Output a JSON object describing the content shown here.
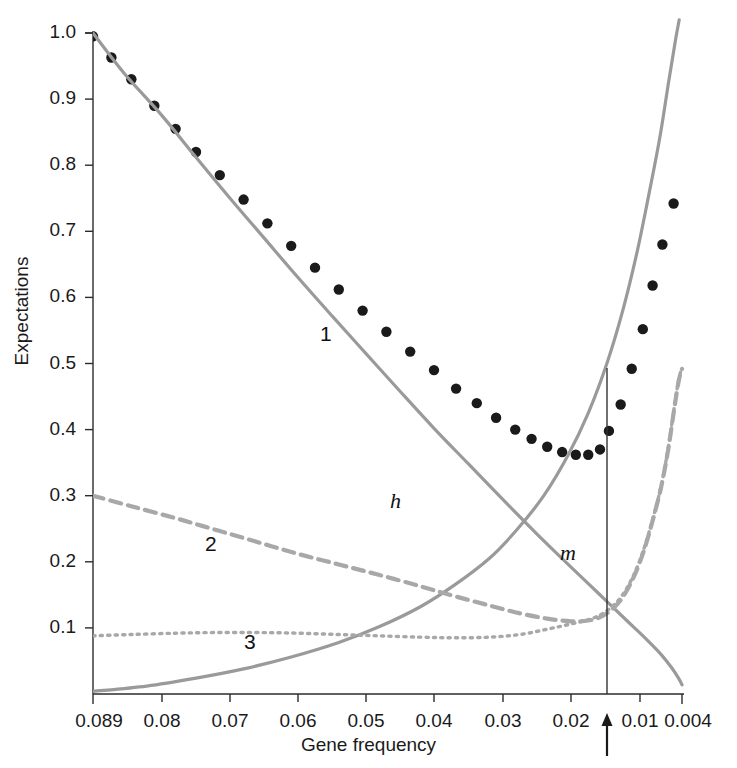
{
  "chart_data": {
    "type": "line",
    "title": "",
    "xlabel": "Gene frequency",
    "ylabel": "Expectations",
    "xtick_labels": [
      "0.089",
      "0.08",
      "0.07",
      "0.06",
      "0.05",
      "0.04",
      "0.03",
      "0.02",
      "0.01",
      "0.004"
    ],
    "xtick_values": [
      0.089,
      0.08,
      0.07,
      0.06,
      0.05,
      0.04,
      0.03,
      0.02,
      0.01,
      0.004
    ],
    "xtick_px": [
      93,
      162,
      230,
      298,
      366,
      434,
      503,
      571,
      640,
      682
    ],
    "ytick_labels": [
      "0.1",
      "0.2",
      "0.3",
      "0.4",
      "0.5",
      "0.6",
      "0.7",
      "0.8",
      "0.9",
      "1.0"
    ],
    "ytick_values": [
      0.1,
      0.2,
      0.3,
      0.4,
      0.5,
      0.6,
      0.7,
      0.8,
      0.9,
      1.0
    ],
    "ylim": [
      0.0,
      1.02
    ],
    "grid": false,
    "legend": "inline-curve-labels",
    "axis_style": "left-and-bottom-spines",
    "annotations": [
      {
        "name": "arrow-marker",
        "type": "up-arrow",
        "x": 0.0145,
        "x_px": 607,
        "note": "vertical reference line with upward arrow below axis"
      }
    ],
    "series": [
      {
        "name": "1",
        "label": "1",
        "style": "dots",
        "marker": "filled-circle",
        "color": "#1a1a1a",
        "label_x_px": 320,
        "label_y_px": 322,
        "points": [
          {
            "x": 0.089,
            "y": 0.995
          },
          {
            "x": 0.0866,
            "y": 0.963
          },
          {
            "x": 0.084,
            "y": 0.93
          },
          {
            "x": 0.081,
            "y": 0.89
          },
          {
            "x": 0.078,
            "y": 0.855
          },
          {
            "x": 0.075,
            "y": 0.82
          },
          {
            "x": 0.0715,
            "y": 0.785
          },
          {
            "x": 0.068,
            "y": 0.748
          },
          {
            "x": 0.0645,
            "y": 0.712
          },
          {
            "x": 0.061,
            "y": 0.678
          },
          {
            "x": 0.0575,
            "y": 0.645
          },
          {
            "x": 0.054,
            "y": 0.612
          },
          {
            "x": 0.0505,
            "y": 0.58
          },
          {
            "x": 0.047,
            "y": 0.548
          },
          {
            "x": 0.0435,
            "y": 0.518
          },
          {
            "x": 0.04,
            "y": 0.49
          },
          {
            "x": 0.0368,
            "y": 0.462
          },
          {
            "x": 0.0338,
            "y": 0.44
          },
          {
            "x": 0.031,
            "y": 0.418
          },
          {
            "x": 0.0282,
            "y": 0.4
          },
          {
            "x": 0.0258,
            "y": 0.386
          },
          {
            "x": 0.0235,
            "y": 0.374
          },
          {
            "x": 0.0213,
            "y": 0.366
          },
          {
            "x": 0.0193,
            "y": 0.362
          },
          {
            "x": 0.0175,
            "y": 0.362
          },
          {
            "x": 0.0158,
            "y": 0.37
          },
          {
            "x": 0.0145,
            "y": 0.398
          },
          {
            "x": 0.0128,
            "y": 0.438
          },
          {
            "x": 0.0112,
            "y": 0.492
          },
          {
            "x": 0.0096,
            "y": 0.552
          },
          {
            "x": 0.0082,
            "y": 0.618
          },
          {
            "x": 0.0068,
            "y": 0.68
          },
          {
            "x": 0.0052,
            "y": 0.742
          }
        ]
      },
      {
        "name": "h",
        "label": "h",
        "style": "solid",
        "color": "#9a9a9a",
        "label_x_px": 390,
        "label_y_px": 488,
        "points": [
          {
            "x": 0.089,
            "y": 1.0
          },
          {
            "x": 0.085,
            "y": 0.94
          },
          {
            "x": 0.08,
            "y": 0.875
          },
          {
            "x": 0.075,
            "y": 0.812
          },
          {
            "x": 0.07,
            "y": 0.75
          },
          {
            "x": 0.065,
            "y": 0.69
          },
          {
            "x": 0.06,
            "y": 0.63
          },
          {
            "x": 0.055,
            "y": 0.572
          },
          {
            "x": 0.05,
            "y": 0.515
          },
          {
            "x": 0.045,
            "y": 0.458
          },
          {
            "x": 0.04,
            "y": 0.402
          },
          {
            "x": 0.035,
            "y": 0.348
          },
          {
            "x": 0.03,
            "y": 0.294
          },
          {
            "x": 0.025,
            "y": 0.242
          },
          {
            "x": 0.02,
            "y": 0.192
          },
          {
            "x": 0.016,
            "y": 0.152
          },
          {
            "x": 0.012,
            "y": 0.112
          },
          {
            "x": 0.009,
            "y": 0.082
          },
          {
            "x": 0.007,
            "y": 0.06
          },
          {
            "x": 0.0055,
            "y": 0.04
          },
          {
            "x": 0.0045,
            "y": 0.024
          },
          {
            "x": 0.004,
            "y": 0.014
          }
        ]
      },
      {
        "name": "m",
        "label": "m",
        "style": "solid",
        "color": "#9a9a9a",
        "label_x_px": 560,
        "label_y_px": 540,
        "points": [
          {
            "x": 0.089,
            "y": 0.004
          },
          {
            "x": 0.082,
            "y": 0.012
          },
          {
            "x": 0.075,
            "y": 0.024
          },
          {
            "x": 0.068,
            "y": 0.038
          },
          {
            "x": 0.061,
            "y": 0.056
          },
          {
            "x": 0.054,
            "y": 0.078
          },
          {
            "x": 0.048,
            "y": 0.102
          },
          {
            "x": 0.042,
            "y": 0.132
          },
          {
            "x": 0.037,
            "y": 0.165
          },
          {
            "x": 0.032,
            "y": 0.205
          },
          {
            "x": 0.028,
            "y": 0.248
          },
          {
            "x": 0.024,
            "y": 0.3
          },
          {
            "x": 0.0205,
            "y": 0.36
          },
          {
            "x": 0.0175,
            "y": 0.425
          },
          {
            "x": 0.0148,
            "y": 0.5
          },
          {
            "x": 0.0125,
            "y": 0.58
          },
          {
            "x": 0.0105,
            "y": 0.665
          },
          {
            "x": 0.0088,
            "y": 0.752
          },
          {
            "x": 0.0072,
            "y": 0.84
          },
          {
            "x": 0.006,
            "y": 0.92
          },
          {
            "x": 0.005,
            "y": 0.985
          },
          {
            "x": 0.0044,
            "y": 1.02
          }
        ]
      },
      {
        "name": "2",
        "label": "2",
        "style": "dashed",
        "color": "#a8a8a8",
        "label_x_px": 205,
        "label_y_px": 532,
        "points": [
          {
            "x": 0.089,
            "y": 0.3
          },
          {
            "x": 0.084,
            "y": 0.284
          },
          {
            "x": 0.078,
            "y": 0.266
          },
          {
            "x": 0.072,
            "y": 0.248
          },
          {
            "x": 0.066,
            "y": 0.23
          },
          {
            "x": 0.06,
            "y": 0.212
          },
          {
            "x": 0.054,
            "y": 0.196
          },
          {
            "x": 0.048,
            "y": 0.18
          },
          {
            "x": 0.042,
            "y": 0.163
          },
          {
            "x": 0.037,
            "y": 0.148
          },
          {
            "x": 0.032,
            "y": 0.134
          },
          {
            "x": 0.0275,
            "y": 0.122
          },
          {
            "x": 0.0235,
            "y": 0.114
          },
          {
            "x": 0.02,
            "y": 0.11
          },
          {
            "x": 0.017,
            "y": 0.112
          },
          {
            "x": 0.0148,
            "y": 0.122
          },
          {
            "x": 0.0128,
            "y": 0.142
          },
          {
            "x": 0.011,
            "y": 0.175
          },
          {
            "x": 0.0095,
            "y": 0.215
          },
          {
            "x": 0.0082,
            "y": 0.262
          },
          {
            "x": 0.007,
            "y": 0.312
          },
          {
            "x": 0.006,
            "y": 0.368
          },
          {
            "x": 0.0052,
            "y": 0.425
          },
          {
            "x": 0.0045,
            "y": 0.472
          },
          {
            "x": 0.004,
            "y": 0.492
          }
        ]
      },
      {
        "name": "3",
        "label": "3",
        "style": "dotted",
        "color": "#a8a8a8",
        "label_x_px": 244,
        "label_y_px": 630,
        "points": [
          {
            "x": 0.089,
            "y": 0.088
          },
          {
            "x": 0.084,
            "y": 0.09
          },
          {
            "x": 0.078,
            "y": 0.092
          },
          {
            "x": 0.072,
            "y": 0.093
          },
          {
            "x": 0.066,
            "y": 0.093
          },
          {
            "x": 0.06,
            "y": 0.092
          },
          {
            "x": 0.054,
            "y": 0.09
          },
          {
            "x": 0.048,
            "y": 0.088
          },
          {
            "x": 0.042,
            "y": 0.086
          },
          {
            "x": 0.037,
            "y": 0.085
          },
          {
            "x": 0.032,
            "y": 0.086
          },
          {
            "x": 0.0275,
            "y": 0.09
          },
          {
            "x": 0.0235,
            "y": 0.098
          },
          {
            "x": 0.02,
            "y": 0.106
          },
          {
            "x": 0.017,
            "y": 0.114
          },
          {
            "x": 0.0148,
            "y": 0.126
          },
          {
            "x": 0.0128,
            "y": 0.146
          },
          {
            "x": 0.011,
            "y": 0.178
          },
          {
            "x": 0.0095,
            "y": 0.218
          },
          {
            "x": 0.0082,
            "y": 0.264
          },
          {
            "x": 0.007,
            "y": 0.314
          },
          {
            "x": 0.006,
            "y": 0.37
          },
          {
            "x": 0.0052,
            "y": 0.427
          },
          {
            "x": 0.0045,
            "y": 0.474
          },
          {
            "x": 0.004,
            "y": 0.494
          }
        ]
      }
    ]
  },
  "colors": {
    "axis": "#2b2b2b",
    "curve_gray": "#9a9a9a",
    "curve_gray_light": "#a8a8a8",
    "dot_black": "#1a1a1a",
    "text": "#1a1a1a",
    "background": "#ffffff"
  }
}
